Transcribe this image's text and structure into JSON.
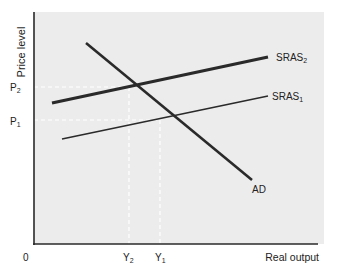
{
  "diagram": {
    "type": "economics-ad-as",
    "y_axis_label": "Price level",
    "x_axis_label": "Real output",
    "origin_label": "0",
    "price_levels": [
      {
        "base": "P",
        "sub": "2",
        "y": 87
      },
      {
        "base": "P",
        "sub": "1",
        "y": 120
      }
    ],
    "output_levels": [
      {
        "base": "Y",
        "sub": "2",
        "x": 129
      },
      {
        "base": "Y",
        "sub": "1",
        "x": 160
      }
    ],
    "curves": [
      {
        "name": "AD",
        "label": "AD",
        "x1": 86,
        "y1": 43,
        "x2": 252,
        "y2": 180,
        "stroke": 2.6
      },
      {
        "name": "SRAS2",
        "label_base": "SRAS",
        "label_sub": "2",
        "x1": 52,
        "y1": 103,
        "x2": 268,
        "y2": 57,
        "stroke": 3.2
      },
      {
        "name": "SRAS1",
        "label_base": "SRAS",
        "label_sub": "1",
        "x1": 62,
        "y1": 139,
        "x2": 268,
        "y2": 96,
        "stroke": 1.6
      }
    ],
    "colors": {
      "plot_bg": "#ececec",
      "line": "#2a2a2a",
      "guide": "#ffffff",
      "text": "#222222"
    }
  }
}
